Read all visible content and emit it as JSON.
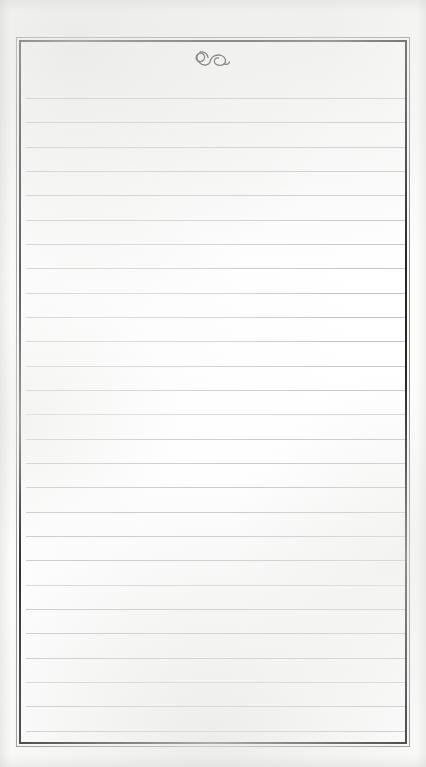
{
  "document": {
    "kind": "scanned-blank-ruled-page",
    "page_background": "#fdfdfc",
    "field_background": "#ffffff",
    "alt_text": "Blank lined notebook page with a double-ruled border and a small calligraphic flourish centered at the top",
    "visible_text": ""
  },
  "frame": {
    "outer_rule_color": "#8e8e92",
    "inner_rule_color": "#26262a",
    "outer_rule_width_px": 1,
    "inner_rule_width_px": 2,
    "left_px": 16,
    "top_px": 37,
    "width_px": 394,
    "height_px": 710
  },
  "ornament": {
    "name": "calligraphic-flourish",
    "description": "small hand-drawn looping flourish resembling a stylised ampersand",
    "color": "#1d1d20",
    "center_x_px": 213,
    "top_px": 46,
    "width_px": 38,
    "height_px": 22
  },
  "ruled_lines": {
    "color": "#c9c9cc",
    "faint_color": "#d6d6d9",
    "count": 27,
    "spacing_px": 24.3,
    "first_line_y_px": 98,
    "inset_left_px": 26,
    "inset_right_px": 405,
    "y_positions": [
      56,
      80,
      105,
      129,
      153,
      178,
      202,
      226,
      251,
      275,
      299,
      324,
      348,
      372,
      397,
      421,
      445,
      470,
      494,
      518,
      543,
      567,
      591,
      616,
      640,
      664,
      689
    ],
    "faint_indices": [
      13,
      20,
      24
    ]
  }
}
